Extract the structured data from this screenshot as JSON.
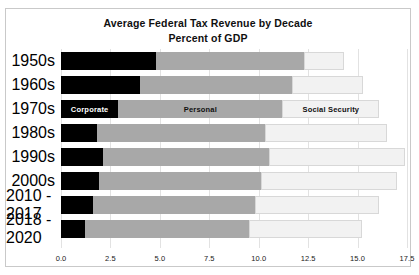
{
  "chart": {
    "title_line1": "Average Federal Tax Revenue by Decade",
    "title_line2": "Percent of GDP"
  },
  "chart_data": {
    "type": "bar",
    "orientation": "horizontal",
    "stacked": true,
    "title": "Average Federal Tax Revenue by Decade Percent of GDP",
    "subtitle": "Percent of GDP",
    "xlabel": "",
    "ylabel": "",
    "xlim": [
      0.0,
      17.5
    ],
    "xticks": [
      "0.0",
      "2.5",
      "5.0",
      "7.5",
      "10.0",
      "12.5",
      "15.0",
      "17.5"
    ],
    "xtick_values": [
      0.0,
      2.5,
      5.0,
      7.5,
      10.0,
      12.5,
      15.0,
      17.5
    ],
    "grid": true,
    "legend_position": "inline-on-1970s-bar",
    "categories": [
      "1950s",
      "1960s",
      "1970s",
      "1980s",
      "1990s",
      "2000s",
      "2010 - 2017",
      "2018 - 2020"
    ],
    "series": [
      {
        "name": "Corporate",
        "color": "#000000",
        "values": [
          4.8,
          4.0,
          2.9,
          1.8,
          2.1,
          1.9,
          1.6,
          1.2
        ]
      },
      {
        "name": "Personal",
        "color": "#a8a8a8",
        "values": [
          7.5,
          7.7,
          8.3,
          8.5,
          8.4,
          8.2,
          8.2,
          8.3
        ]
      },
      {
        "name": "Social Security",
        "color": "#f2f2f2",
        "values": [
          2.0,
          3.6,
          4.9,
          6.2,
          6.9,
          6.9,
          6.3,
          5.7
        ]
      }
    ],
    "totals": [
      14.3,
      15.3,
      16.1,
      16.5,
      17.4,
      17.0,
      16.1,
      15.2
    ]
  }
}
